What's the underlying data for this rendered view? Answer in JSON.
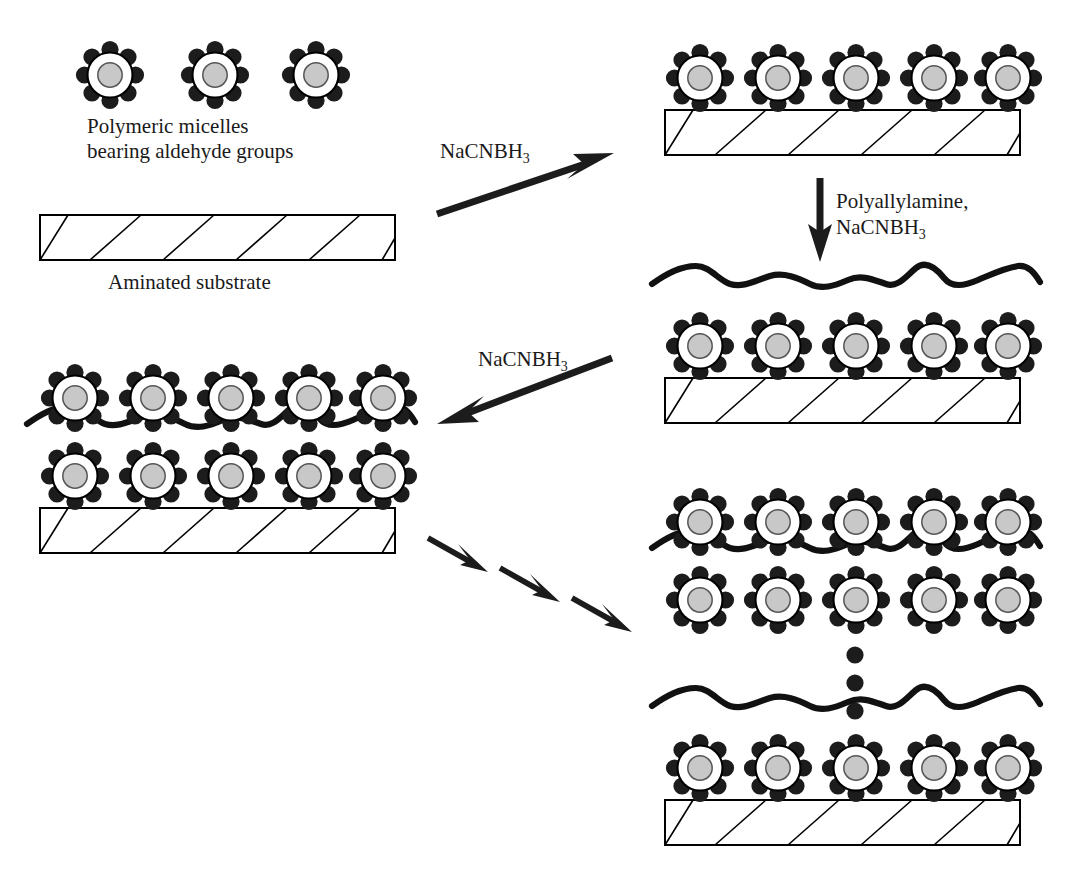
{
  "figure": {
    "title_visible": false,
    "background_color": "#ffffff",
    "width": 1074,
    "height": 882
  },
  "palette": {
    "stroke": "#000000",
    "dot_fill": "#1c1c1c",
    "core_fill": "#c8c8c8",
    "shell_fill": "#ffffff",
    "chain_stroke": "#111111",
    "text_color": "#1a1a1a",
    "substrate_fill": "#ffffff"
  },
  "labels": {
    "micelles_line1": "Polymeric micelles",
    "micelles_line2": "bearing aldehyde groups",
    "substrate": "Aminated substrate",
    "reagent_1": "NaCNBH",
    "reagent_1_sub": "3",
    "reagent_2_line1": "Polyallylamine,",
    "reagent_2_line2": "NaCNBH",
    "reagent_2_sub": "3",
    "reagent_3": "NaCNBH",
    "reagent_3_sub": "3"
  },
  "legend_icons": {
    "micelle": "micelle-icon",
    "aldehyde_group": "aldehyde-dot-icon",
    "polymer_chain": "polymer-chain-icon",
    "substrate": "hatched-substrate-icon",
    "ellipsis": "vertical-ellipsis-icon"
  },
  "stages": [
    {
      "id": "free-micelles",
      "name": "Free polymeric micelles",
      "micelle_count": 3,
      "has_substrate": false,
      "has_chain": false,
      "layers": 0
    },
    {
      "id": "bare-substrate",
      "name": "Aminated substrate",
      "micelle_count": 0,
      "has_substrate": true,
      "has_chain": false,
      "layers": 0
    },
    {
      "id": "monolayer-on-substrate",
      "name": "Micelle monolayer on substrate",
      "micelle_count": 5,
      "has_substrate": true,
      "has_chain": false,
      "layers": 1
    },
    {
      "id": "monolayer-with-chain",
      "name": "Micelle monolayer capped with polyallylamine",
      "micelle_count": 5,
      "has_substrate": true,
      "has_chain": true,
      "layers": 1
    },
    {
      "id": "bilayer-on-substrate",
      "name": "Micelle bilayer on substrate",
      "micelle_count": 10,
      "has_substrate": true,
      "has_chain": true,
      "layers": 2
    },
    {
      "id": "bilayer-floating",
      "name": "Repeated bilayer assembly",
      "micelle_count": 10,
      "has_substrate": false,
      "has_chain": true,
      "layers": 2
    },
    {
      "id": "multilayer-final",
      "name": "Final multilayer film on substrate",
      "micelle_count": 5,
      "has_substrate": true,
      "has_chain": true,
      "layers": 1
    }
  ],
  "arrows": [
    {
      "id": "arrow-1",
      "name": "arrow-deposit-micelles",
      "direction": "up-right",
      "label": "NaCNBH3"
    },
    {
      "id": "arrow-2",
      "name": "arrow-add-polyallylamine",
      "direction": "down",
      "label": "Polyallylamine, NaCNBH3"
    },
    {
      "id": "arrow-3",
      "name": "arrow-second-micelle-layer",
      "direction": "down-left",
      "label": "NaCNBH3"
    },
    {
      "id": "arrow-4a",
      "name": "arrow-repeat-step-1",
      "direction": "down-right",
      "label": ""
    },
    {
      "id": "arrow-4b",
      "name": "arrow-repeat-step-2",
      "direction": "down-right",
      "label": ""
    },
    {
      "id": "arrow-4c",
      "name": "arrow-repeat-step-3",
      "direction": "down-right",
      "label": ""
    }
  ],
  "ellipsis": {
    "name": "vertical-ellipsis",
    "dot_count": 3
  }
}
